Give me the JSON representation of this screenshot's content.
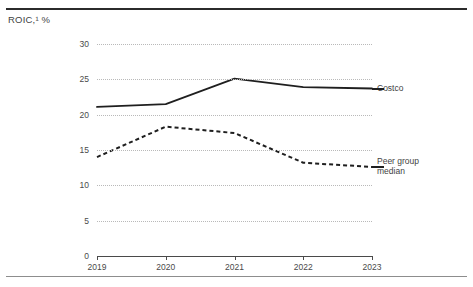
{
  "chart_data": {
    "type": "line",
    "title": "ROIC,¹ %",
    "xlabel": "",
    "ylabel": "",
    "x": [
      "2019",
      "2020",
      "2021",
      "2022",
      "2023"
    ],
    "categories": [
      "2019",
      "2020",
      "2021",
      "2022",
      "2023"
    ],
    "yticks": [
      0,
      5,
      10,
      15,
      20,
      25,
      30
    ],
    "ytick_labels": [
      "0",
      "5",
      "10",
      "15",
      "20",
      "25",
      "30"
    ],
    "ylim": [
      0,
      30
    ],
    "grid": "horizontal-dotted",
    "legend_position": "right-inline",
    "series": [
      {
        "name": "Costco",
        "style": "solid",
        "color": "#1f1f1f",
        "values": [
          21.1,
          21.5,
          25.1,
          23.9,
          23.7
        ]
      },
      {
        "name": "Peer group median",
        "style": "dashed",
        "color": "#1f1f1f",
        "values": [
          14.0,
          18.3,
          17.4,
          13.2,
          12.6
        ]
      }
    ]
  },
  "legend": {
    "costco": "Costco",
    "peer_line1": "Peer group",
    "peer_line2": "median"
  },
  "colors": {
    "line": "#1f1f1f",
    "grid": "#b9b9b9",
    "axis": "#4a4a4a",
    "rule_top": "#2b2b2b",
    "rule_bottom": "#8d8d8d",
    "text": "#3f3f3f",
    "background": "#ffffff"
  }
}
